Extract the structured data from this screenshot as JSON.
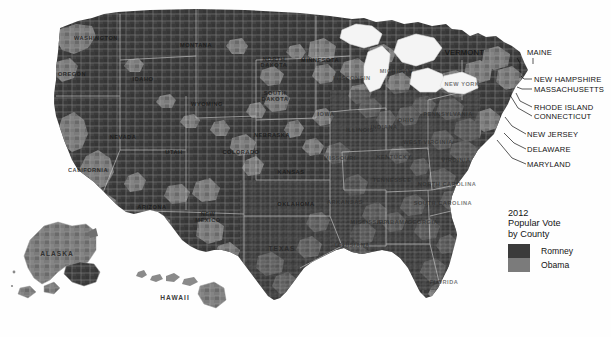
{
  "map": {
    "title_alt": "2012 United States presidential election results by county",
    "colors": {
      "romney": "#3b3b3b",
      "obama": "#7b7b7b",
      "water": "#f2f2f2",
      "background": "#fefefe",
      "county_border": "#9a9a9a",
      "state_border": "#d8d8d8",
      "label": "#1d1d1d"
    },
    "state_labels": [
      {
        "name": "WASHINGTON",
        "x": 96,
        "y": 38,
        "style": "ondark"
      },
      {
        "name": "OREGON",
        "x": 72,
        "y": 74,
        "style": "ondark"
      },
      {
        "name": "MONTANA",
        "x": 196,
        "y": 45,
        "style": "ondark"
      },
      {
        "name": "IDAHO",
        "x": 143,
        "y": 79,
        "style": "ondark"
      },
      {
        "name": "WYOMING",
        "x": 207,
        "y": 104,
        "style": "ondark"
      },
      {
        "name": "NEVADA",
        "x": 123,
        "y": 137,
        "style": "ondark"
      },
      {
        "name": "UTAH",
        "x": 174,
        "y": 152,
        "style": "ondark"
      },
      {
        "name": "CALIFORNIA",
        "x": 88,
        "y": 170,
        "style": "ondark"
      },
      {
        "name": "ARIZONA",
        "x": 152,
        "y": 207,
        "style": "ondark"
      },
      {
        "name": "NEW MEXICO",
        "x": 208,
        "y": 217,
        "style": "two"
      },
      {
        "name": "COLORADO",
        "x": 241,
        "y": 152,
        "style": "ondark"
      },
      {
        "name": "NORTH DAKOTA",
        "x": 274,
        "y": 62,
        "style": "two"
      },
      {
        "name": "SOUTH DAKOTA",
        "x": 275,
        "y": 96,
        "style": "two"
      },
      {
        "name": "NEBRASKA",
        "x": 272,
        "y": 135,
        "style": "ondark"
      },
      {
        "name": "KANSAS",
        "x": 291,
        "y": 172,
        "style": "ondark"
      },
      {
        "name": "OKLAHOMA",
        "x": 296,
        "y": 204,
        "style": "ondark"
      },
      {
        "name": "TEXAS",
        "x": 282,
        "y": 248,
        "style": "big"
      },
      {
        "name": "MINNESOTA",
        "x": 320,
        "y": 60,
        "style": "ondark"
      },
      {
        "name": "IOWA",
        "x": 326,
        "y": 114,
        "style": "lite"
      },
      {
        "name": "MISSOURI",
        "x": 340,
        "y": 158,
        "style": "lite"
      },
      {
        "name": "ARKANSAS",
        "x": 345,
        "y": 202,
        "style": "lite"
      },
      {
        "name": "LOUISIANA",
        "x": 352,
        "y": 245,
        "style": "lite"
      },
      {
        "name": "WISCONSIN",
        "x": 352,
        "y": 78,
        "style": "lite"
      },
      {
        "name": "ILLINOIS",
        "x": 360,
        "y": 130,
        "style": "lite"
      },
      {
        "name": "MICHIGAN",
        "x": 396,
        "y": 71,
        "style": "lite"
      },
      {
        "name": "INDIANA",
        "x": 384,
        "y": 127,
        "style": "lite"
      },
      {
        "name": "OHIO",
        "x": 406,
        "y": 120,
        "style": "lite"
      },
      {
        "name": "KENTUCKY",
        "x": 394,
        "y": 157,
        "style": "lite"
      },
      {
        "name": "TENNESSEE",
        "x": 392,
        "y": 180,
        "style": "lite"
      },
      {
        "name": "MISSISSIPPI",
        "x": 370,
        "y": 222,
        "style": "lite"
      },
      {
        "name": "ALABAMA",
        "x": 393,
        "y": 222,
        "style": "lite"
      },
      {
        "name": "GEORGIA",
        "x": 423,
        "y": 222,
        "style": "lite"
      },
      {
        "name": "FLORIDA",
        "x": 444,
        "y": 282,
        "style": "lite"
      },
      {
        "name": "SOUTH CAROLINA",
        "x": 443,
        "y": 203,
        "style": "lite"
      },
      {
        "name": "NORTH CAROLINA",
        "x": 447,
        "y": 184,
        "style": "lite"
      },
      {
        "name": "VIRGINIA",
        "x": 456,
        "y": 160,
        "style": "lite"
      },
      {
        "name": "WEST VIRGINIA",
        "x": 428,
        "y": 142,
        "style": "lite"
      },
      {
        "name": "PENNSYLVANIA",
        "x": 448,
        "y": 114,
        "style": "lite"
      },
      {
        "name": "NEW YORK",
        "x": 462,
        "y": 84,
        "style": "lite"
      },
      {
        "name": "ALASKA",
        "x": 57,
        "y": 253,
        "style": "big"
      },
      {
        "name": "HAWAII",
        "x": 175,
        "y": 297,
        "style": "big"
      }
    ],
    "callouts": [
      {
        "name": "VERMONT",
        "text_x": 484,
        "text_y": 55,
        "anchor": "end",
        "line": [
          [
            517,
            58
          ],
          [
            520,
            63
          ],
          [
            520,
            78
          ]
        ]
      },
      {
        "name": "MAINE",
        "text_x": 527,
        "text_y": 55,
        "anchor": "start",
        "line": [
          [
            533,
            58
          ],
          [
            533,
            64
          ]
        ]
      },
      {
        "name": "NEW HAMPSHIRE",
        "text_x": 534,
        "text_y": 82,
        "anchor": "start",
        "line": [
          [
            532,
            79
          ],
          [
            524,
            79
          ],
          [
            521,
            76
          ]
        ]
      },
      {
        "name": "MASSACHUSETTS",
        "text_x": 534,
        "text_y": 92,
        "anchor": "start",
        "line": [
          [
            532,
            89
          ],
          [
            522,
            89
          ],
          [
            517,
            87
          ]
        ]
      },
      {
        "name": "RHODE ISLAND",
        "text_x": 534,
        "text_y": 110,
        "anchor": "start",
        "line": [
          [
            532,
            107
          ],
          [
            520,
            101
          ],
          [
            516,
            93
          ]
        ]
      },
      {
        "name": "CONNECTICUT",
        "text_x": 534,
        "text_y": 119,
        "anchor": "start",
        "line": [
          [
            532,
            116
          ],
          [
            518,
            108
          ],
          [
            510,
            95
          ]
        ]
      },
      {
        "name": "NEW JERSEY",
        "text_x": 527,
        "text_y": 137,
        "anchor": "start",
        "line": [
          [
            526,
            134
          ],
          [
            512,
            126
          ],
          [
            505,
            117
          ]
        ]
      },
      {
        "name": "DELAWARE",
        "text_x": 527,
        "text_y": 152,
        "anchor": "start",
        "line": [
          [
            526,
            149
          ],
          [
            514,
            143
          ],
          [
            504,
            133
          ]
        ]
      },
      {
        "name": "MARYLAND",
        "text_x": 527,
        "text_y": 167,
        "anchor": "start",
        "line": [
          [
            526,
            164
          ],
          [
            512,
            158
          ],
          [
            497,
            140
          ]
        ]
      }
    ]
  },
  "legend": {
    "title_line1": "2012",
    "title_line2": "Popular Vote",
    "title_line3": "by County",
    "entries": [
      {
        "label": "Romney",
        "color": "#3b3b3b"
      },
      {
        "label": "Obama",
        "color": "#7b7b7b"
      }
    ]
  },
  "chart_data": {
    "type": "heatmap",
    "title": "2012 Popular Vote by County",
    "subtitle": "United States presidential election results, county choropleth",
    "legend_position": "right-center",
    "categories": [
      "Romney",
      "Obama"
    ],
    "colors": [
      "#3b3b3b",
      "#7b7b7b"
    ],
    "values": [
      2422,
      698
    ],
    "value_label": "counties won (approx.)",
    "xlabel": "",
    "ylabel": "",
    "grid": false
  }
}
